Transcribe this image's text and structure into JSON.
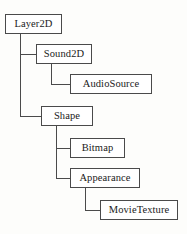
{
  "diagram": {
    "type": "class-hierarchy-tree",
    "title": "",
    "background_color": "#fdfdfb",
    "box_fill_color": "#ffffff",
    "box_border_color": "#4a4a4a",
    "connector_color": "#4a4a4a",
    "text_color": "#1a1a1a",
    "nodes": [
      {
        "id": "layer2d",
        "label": "Layer2D",
        "x": 5,
        "y": 14,
        "w": 57,
        "h": 20,
        "parent": null
      },
      {
        "id": "sound2d",
        "label": "Sound2D",
        "x": 36,
        "y": 44,
        "w": 56,
        "h": 20,
        "parent": "layer2d"
      },
      {
        "id": "audiosource",
        "label": "AudioSource",
        "x": 70,
        "y": 74,
        "w": 82,
        "h": 20,
        "parent": "sound2d"
      },
      {
        "id": "shape",
        "label": "Shape",
        "x": 41,
        "y": 106,
        "w": 52,
        "h": 20,
        "parent": "layer2d"
      },
      {
        "id": "bitmap",
        "label": "Bitmap",
        "x": 70,
        "y": 138,
        "w": 55,
        "h": 20,
        "parent": "shape"
      },
      {
        "id": "appearance",
        "label": "Appearance",
        "x": 70,
        "y": 168,
        "w": 70,
        "h": 20,
        "parent": "shape"
      },
      {
        "id": "movietexture",
        "label": "MovieTexture",
        "x": 100,
        "y": 200,
        "w": 78,
        "h": 20,
        "parent": "appearance"
      }
    ],
    "edges": [
      {
        "from": "layer2d",
        "to": "sound2d",
        "style": "elbow"
      },
      {
        "from": "layer2d",
        "to": "shape",
        "style": "elbow"
      },
      {
        "from": "sound2d",
        "to": "audiosource",
        "style": "elbow"
      },
      {
        "from": "shape",
        "to": "bitmap",
        "style": "elbow"
      },
      {
        "from": "shape",
        "to": "appearance",
        "style": "elbow"
      },
      {
        "from": "appearance",
        "to": "movietexture",
        "style": "elbow"
      }
    ]
  }
}
